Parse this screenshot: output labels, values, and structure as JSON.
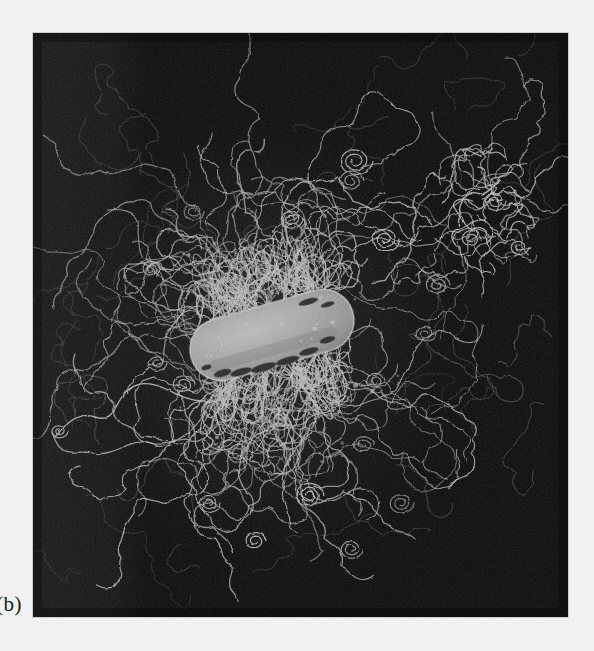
{
  "figure": {
    "panel_label": "(b)",
    "caption_visible": true,
    "background_color": "#f2f2f2",
    "panel": {
      "x": 33,
      "y": 33,
      "width": 535,
      "height": 584,
      "background_color": "#0a0a0a",
      "border_color": "#cfcfcf"
    }
  },
  "micrograph": {
    "modality": "transmission-electron-micrograph",
    "subject": "rod-shaped bacterial cell with dense peritrichous fimbriae",
    "cell_body": {
      "name": "bacterial-cell-body",
      "fill_color": "#9b9b9b",
      "highlight_color": "#b4b4b4",
      "shadow_color": "#6d6d6d",
      "outline_color": "#d8d8d8",
      "center_x": 272,
      "center_y": 335,
      "length": 165,
      "width": 62,
      "rotation_deg": -16
    },
    "filaments": {
      "name": "fimbriae-filaments",
      "stroke_color": "#b9b9b9",
      "stroke_color_faint": "#6a6a6a",
      "count_visible": 140,
      "appearance": "thin beaded curling threads radiating from cell surface"
    },
    "detached_cluster": {
      "name": "detached-filament-cluster",
      "center_x": 478,
      "center_y": 205,
      "description": "separate tangle of filaments at upper right"
    },
    "long_filament_left": {
      "name": "long-trailing-filament",
      "description": "single sinuous filament trailing to the left edge",
      "start_x": 205,
      "start_y": 400,
      "end_x": 52,
      "end_y": 432
    },
    "vertical_band": {
      "name": "exposure-band",
      "x_start": 33,
      "x_end": 145,
      "tone": "#141414",
      "description": "slightly lighter vertical exposure band along left of plate"
    }
  }
}
